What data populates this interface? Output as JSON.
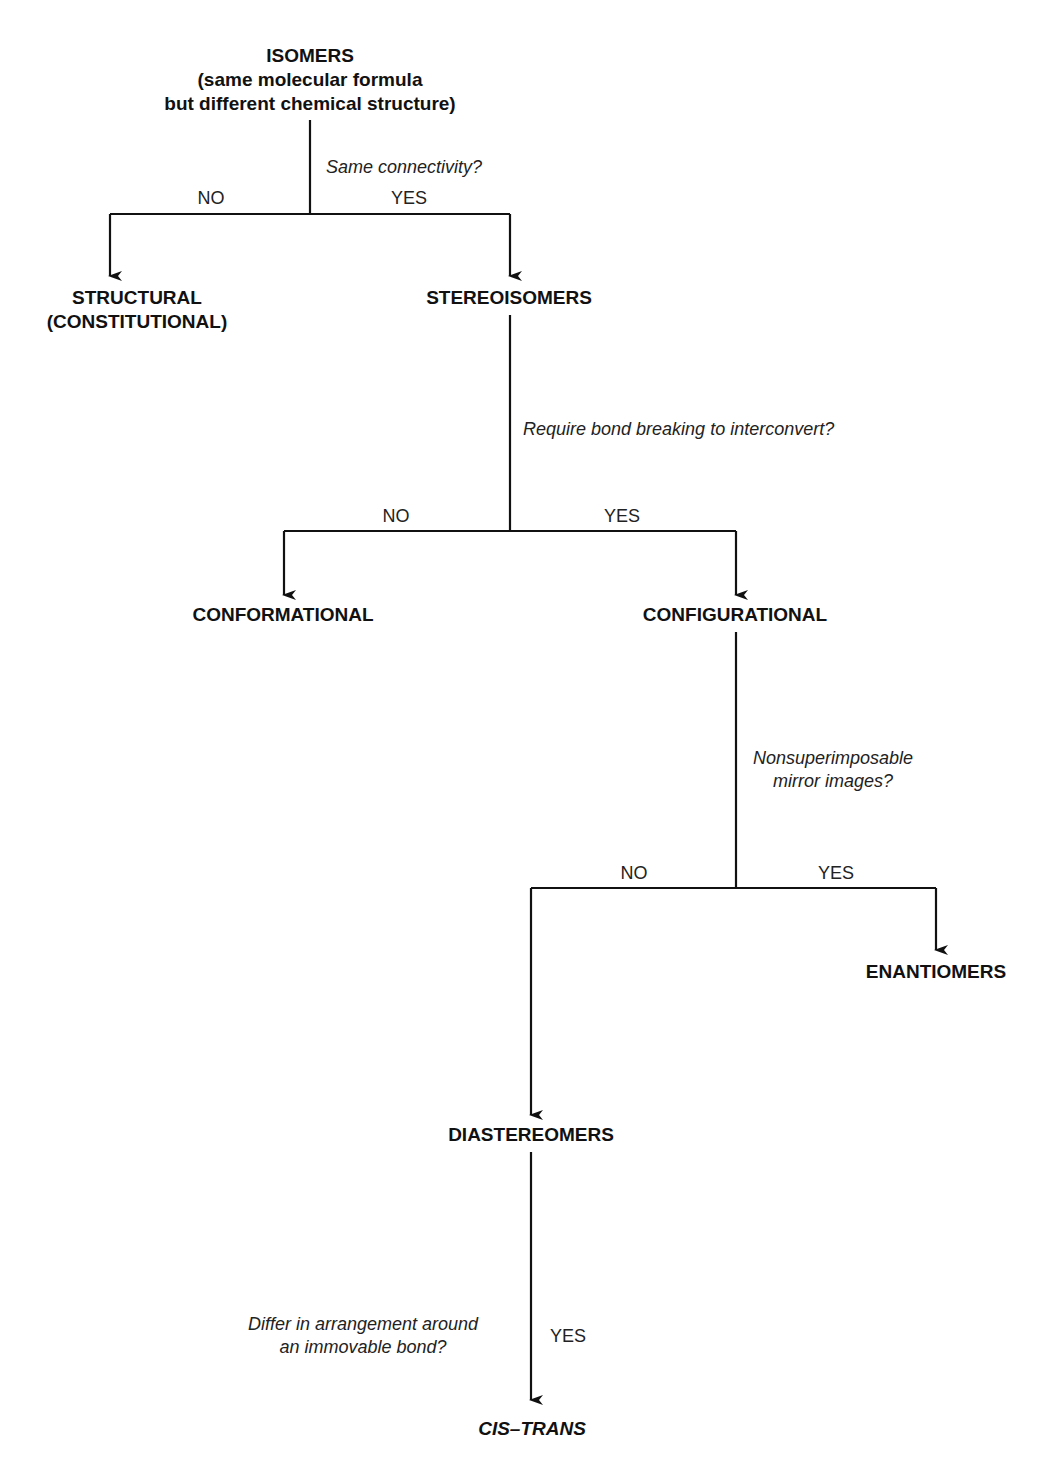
{
  "diagram": {
    "root": {
      "title": "ISOMERS",
      "subtitle_line1": "(same molecular formula",
      "subtitle_line2": "but different chemical structure)"
    },
    "questions": {
      "q1": "Same connectivity?",
      "q2": "Require bond breaking to interconvert?",
      "q3_line1": "Nonsuperimposable",
      "q3_line2": "mirror images?",
      "q4_line1": "Differ in arrangement around",
      "q4_line2": "an immovable bond?"
    },
    "branches": {
      "q1_no": "NO",
      "q1_yes": "YES",
      "q2_no": "NO",
      "q2_yes": "YES",
      "q3_no": "NO",
      "q3_yes": "YES",
      "q4_yes": "YES"
    },
    "nodes": {
      "structural_line1": "STRUCTURAL",
      "structural_line2": "(CONSTITUTIONAL)",
      "stereoisomers": "STEREOISOMERS",
      "conformational": "CONFORMATIONAL",
      "configurational": "CONFIGURATIONAL",
      "enantiomers": "ENANTIOMERS",
      "diastereomers": "DIASTEREOMERS",
      "cis_trans": "CIS–TRANS"
    },
    "line_color": "#111111"
  }
}
